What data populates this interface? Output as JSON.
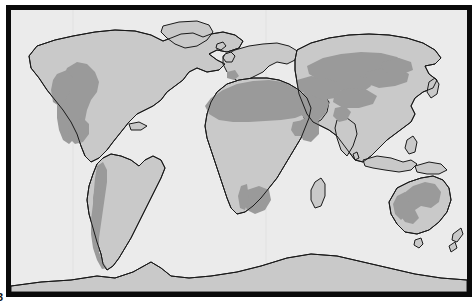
{
  "figure": {
    "projection": "world-flat",
    "folio_mark": "3",
    "colors": {
      "ocean": "#ebebeb",
      "land": "#c9c9c9",
      "arid": "#9a9a9a",
      "coastline": "#1a1a1a",
      "frame": "#0a0a0a",
      "page": "#ffffff",
      "graticule": "#dedede"
    },
    "frame": {
      "border_width_px": 5,
      "inset_left_px": 6,
      "inset_top_px": 5
    }
  },
  "legend": {
    "shown": false,
    "classes": [
      {
        "key": "arid",
        "label": "Arid / semi-arid drylands",
        "color": "#9a9a9a"
      },
      {
        "key": "land",
        "label": "Other land",
        "color": "#c9c9c9"
      },
      {
        "key": "ocean",
        "label": "Ocean",
        "color": "#ebebeb"
      }
    ]
  },
  "landmasses": [
    {
      "name": "north-america",
      "label": "North America"
    },
    {
      "name": "greenland",
      "label": "Greenland"
    },
    {
      "name": "south-america",
      "label": "South America"
    },
    {
      "name": "europe",
      "label": "Europe"
    },
    {
      "name": "africa",
      "label": "Africa"
    },
    {
      "name": "asia",
      "label": "Asia"
    },
    {
      "name": "australia",
      "label": "Australia"
    },
    {
      "name": "antarctica",
      "label": "Antarctica"
    },
    {
      "name": "madagascar",
      "label": "Madagascar"
    },
    {
      "name": "new-zealand",
      "label": "New Zealand"
    },
    {
      "name": "japan",
      "label": "Japan"
    },
    {
      "name": "british-isles",
      "label": "British Isles"
    },
    {
      "name": "indonesia",
      "label": "Indonesia"
    }
  ],
  "arid_regions": [
    {
      "name": "southwest-north-america",
      "label": "Southwestern North America"
    },
    {
      "name": "patagonia-andes",
      "label": "Andes and Patagonia"
    },
    {
      "name": "sahara",
      "label": "Sahara"
    },
    {
      "name": "horn-of-africa",
      "label": "Horn of Africa"
    },
    {
      "name": "kalahari-namib",
      "label": "Kalahari and Namib"
    },
    {
      "name": "arabian-peninsula",
      "label": "Arabian Peninsula"
    },
    {
      "name": "central-asia",
      "label": "Central Asia"
    },
    {
      "name": "gobi-taklamakan",
      "label": "Gobi and Taklamakan"
    },
    {
      "name": "thar",
      "label": "Thar"
    },
    {
      "name": "australian-interior",
      "label": "Australian interior"
    },
    {
      "name": "iberia-south",
      "label": "Southern Iberia"
    }
  ]
}
